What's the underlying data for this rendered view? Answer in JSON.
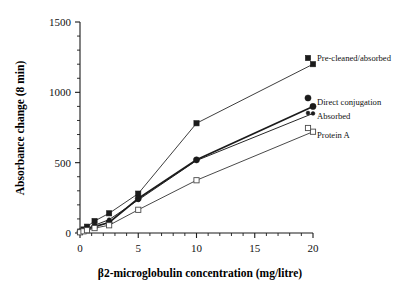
{
  "chart_data": {
    "type": "line",
    "title": "",
    "xlabel": "β2-microglobulin concentration  (mg/litre)",
    "ylabel": "Absorbance change (8 min)",
    "xlim": [
      0,
      20
    ],
    "ylim": [
      0,
      1500
    ],
    "xticks": [
      0,
      5,
      10,
      15,
      20
    ],
    "xtick_labels": [
      "0",
      "5",
      "10",
      "15",
      "20"
    ],
    "yticks": [
      0,
      500,
      1000,
      1500
    ],
    "ytick_labels": [
      "0",
      "500",
      "1000",
      "1500"
    ],
    "x_minor_step": 1,
    "y_minor_step": 100,
    "grid": false,
    "legend_position": "right-inline",
    "series": [
      {
        "name": "Pre-cleaned/absorbed",
        "marker": "filled-square",
        "color": "#1b1b1b",
        "x": [
          0,
          0.3,
          0.6,
          1.25,
          2.5,
          5,
          10,
          20
        ],
        "values": [
          10,
          25,
          45,
          85,
          140,
          280,
          780,
          1200
        ]
      },
      {
        "name": "Direct conjugation",
        "marker": "filled-circle",
        "color": "#1b1b1b",
        "x": [
          0,
          0.3,
          0.6,
          1.25,
          2.5,
          5,
          10,
          20
        ],
        "values": [
          8,
          18,
          28,
          45,
          75,
          245,
          520,
          900
        ]
      },
      {
        "name": "Absorbed",
        "marker": "small-filled-circle",
        "color": "#1b1b1b",
        "x": [
          0,
          0.3,
          0.6,
          1.25,
          2.5,
          5,
          10,
          20
        ],
        "values": [
          8,
          20,
          32,
          55,
          95,
          235,
          515,
          850
        ]
      },
      {
        "name": "Protein A",
        "marker": "open-square",
        "color": "#4a4a4a",
        "x": [
          0,
          0.3,
          0.6,
          1.25,
          2.5,
          5,
          10,
          20
        ],
        "values": [
          5,
          12,
          20,
          35,
          55,
          165,
          375,
          720
        ]
      }
    ],
    "legend_entries": [
      {
        "label": "Pre-cleaned/absorbed",
        "marker": "filled-square"
      },
      {
        "label": "Direct conjugation",
        "marker": "filled-circle"
      },
      {
        "label": "Absorbed",
        "marker": "small-filled-circle"
      },
      {
        "label": "Protein A",
        "marker": "open-square"
      }
    ]
  }
}
